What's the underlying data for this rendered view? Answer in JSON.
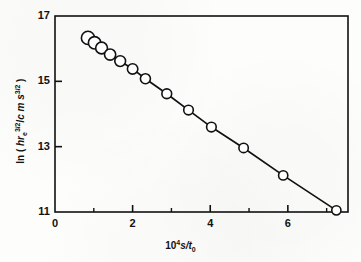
{
  "chart_data": {
    "type": "scatter",
    "title": "",
    "xlabel": "10^4 s/t_0",
    "xlabel_parts": {
      "base": "10",
      "exponent": "4",
      "mid": "s/t",
      "subscript": "0"
    },
    "ylabel": "ln ( hr_e^3/2 / c m s^3/2 )",
    "ylabel_parts": {
      "prefix": "ln (",
      "numerator_symbol": "hr",
      "numerator_sub": "e",
      "numerator_exp": "3/2",
      "divider": "/",
      "denominator": "c m s",
      "denominator_exp": "3/2",
      "suffix": ")"
    },
    "xlim": [
      0,
      7.55
    ],
    "ylim": [
      11,
      17
    ],
    "xticks": [
      0,
      2,
      4,
      6
    ],
    "xticklabels": [
      "0",
      "2",
      "4",
      "6"
    ],
    "x_minor_ticks": [
      1,
      3,
      5,
      7
    ],
    "yticks": [
      11,
      13,
      15,
      17
    ],
    "yticklabels": [
      "11",
      "13",
      "15",
      "17"
    ],
    "grid": false,
    "legend": null,
    "marker": "open-circle",
    "line_style": "solid",
    "color": "#111111",
    "x": [
      0.85,
      1.02,
      1.2,
      1.42,
      1.68,
      2.0,
      2.33,
      2.88,
      3.44,
      4.03,
      4.86,
      5.88,
      7.25
    ],
    "y": [
      16.33,
      16.18,
      16.02,
      15.82,
      15.62,
      15.38,
      15.08,
      14.62,
      14.12,
      13.6,
      12.96,
      12.12,
      11.05
    ],
    "marker_sizes": [
      6.6,
      6.2,
      5.9,
      5.6,
      5.4,
      5.2,
      5.0,
      4.9,
      4.8,
      4.8,
      4.7,
      4.6,
      4.6
    ],
    "point_count": 13
  },
  "axes": {
    "frame": {
      "left": 55,
      "right": 348,
      "top": 16,
      "bottom": 212
    }
  }
}
